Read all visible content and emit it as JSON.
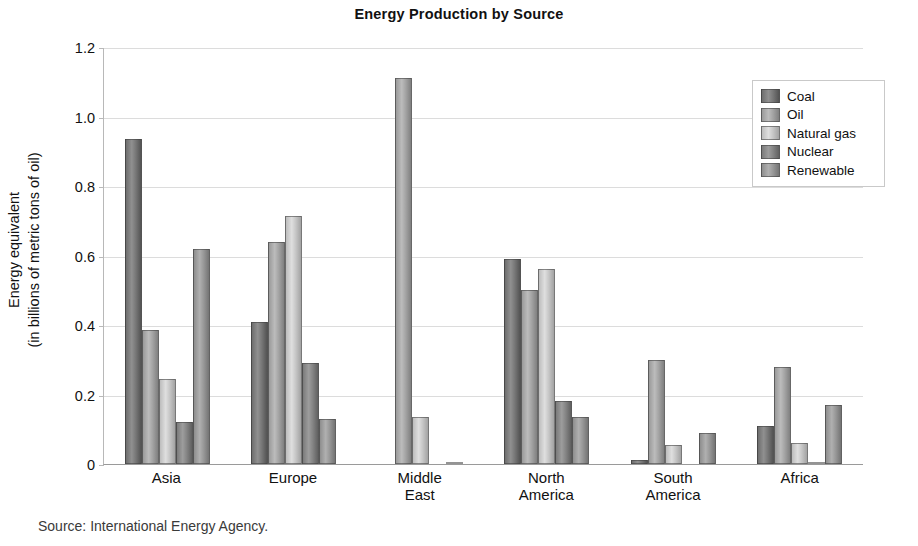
{
  "chart_data": {
    "type": "bar",
    "title": "Energy Production by Source",
    "xlabel": "",
    "ylabel": "Energy equivalent\n(in billions of metric tons of oil)",
    "ylabel_line1": "Energy equivalent",
    "ylabel_line2": "(in billions of metric tons of oil)",
    "ylim": [
      0,
      1.2
    ],
    "yticks": [
      "0",
      "0.2",
      "0.4",
      "0.6",
      "0.8",
      "1.0",
      "1.2"
    ],
    "ytick_values": [
      0,
      0.2,
      0.4,
      0.6,
      0.8,
      1.0,
      1.2
    ],
    "grid": true,
    "legend_position": "top-right",
    "categories": [
      "Asia",
      "Europe",
      "Middle East",
      "North America",
      "South America",
      "Africa"
    ],
    "category_lines": [
      [
        "Asia"
      ],
      [
        "Europe"
      ],
      [
        "Middle",
        "East"
      ],
      [
        "North",
        "America"
      ],
      [
        "South",
        "America"
      ],
      [
        "Africa"
      ]
    ],
    "series": [
      {
        "name": "Coal",
        "color": "#6e6e6e",
        "values": [
          0.935,
          0.41,
          0.0,
          0.59,
          0.012,
          0.11
        ]
      },
      {
        "name": "Oil",
        "color": "#9a9a9a",
        "values": [
          0.385,
          0.64,
          1.11,
          0.5,
          0.3,
          0.28
        ]
      },
      {
        "name": "Natural gas",
        "color": "#bdbdbd",
        "values": [
          0.245,
          0.715,
          0.135,
          0.56,
          0.055,
          0.06
        ]
      },
      {
        "name": "Nuclear",
        "color": "#7b7b7b",
        "values": [
          0.12,
          0.29,
          0.0,
          0.18,
          0.0,
          0.005
        ]
      },
      {
        "name": "Renewable",
        "color": "#8e8e8e",
        "values": [
          0.62,
          0.13,
          0.005,
          0.135,
          0.09,
          0.17
        ]
      }
    ],
    "source_note": "Source: International Energy Agency."
  },
  "legend": {
    "items": [
      {
        "label": "Coal"
      },
      {
        "label": "Oil"
      },
      {
        "label": "Natural gas"
      },
      {
        "label": "Nuclear"
      },
      {
        "label": "Renewable"
      }
    ]
  },
  "colors": {
    "gridline": "#dcdcdc",
    "axis": "#b8b8b8",
    "text": "#111111",
    "background": "#ffffff"
  }
}
